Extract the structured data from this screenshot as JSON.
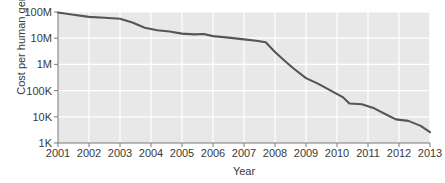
{
  "chart_data": {
    "type": "line",
    "title": "",
    "xlabel": "Year",
    "ylabel": "Cost per human genome ($)",
    "yscale": "log",
    "ylim": [
      1000,
      100000000
    ],
    "xlim": [
      2001,
      2013
    ],
    "grid": true,
    "legend": null,
    "line_color": "#555555",
    "plot_bg": "#e8e8e8",
    "grid_color": "#ffffff",
    "yticks": [
      {
        "value": 100000000,
        "label": "100M"
      },
      {
        "value": 10000000,
        "label": "10M"
      },
      {
        "value": 1000000,
        "label": "1M"
      },
      {
        "value": 100000,
        "label": "100K"
      },
      {
        "value": 10000,
        "label": "10K"
      },
      {
        "value": 1000,
        "label": "1K"
      }
    ],
    "xticks": [
      {
        "value": 2001,
        "label": "2001"
      },
      {
        "value": 2002,
        "label": "2002"
      },
      {
        "value": 2003,
        "label": "2003"
      },
      {
        "value": 2004,
        "label": "2004"
      },
      {
        "value": 2005,
        "label": "2005"
      },
      {
        "value": 2006,
        "label": "2006"
      },
      {
        "value": 2007,
        "label": "2007"
      },
      {
        "value": 2008,
        "label": "2008"
      },
      {
        "value": 2009,
        "label": "2009"
      },
      {
        "value": 2010,
        "label": "2010"
      },
      {
        "value": 2011,
        "label": "2011"
      },
      {
        "value": 2012,
        "label": "2012"
      },
      {
        "value": 2013,
        "label": "2013"
      }
    ],
    "series": [
      {
        "name": "Cost per human genome",
        "x": [
          2001.0,
          2001.5,
          2002.0,
          2002.5,
          2003.0,
          2003.4,
          2003.8,
          2004.2,
          2004.6,
          2005.0,
          2005.4,
          2005.7,
          2006.0,
          2006.5,
          2007.0,
          2007.4,
          2007.7,
          2008.0,
          2008.3,
          2008.6,
          2009.0,
          2009.4,
          2009.8,
          2010.2,
          2010.4,
          2010.8,
          2011.2,
          2011.6,
          2011.9,
          2012.3,
          2012.7,
          2013.0
        ],
        "y": [
          95000000,
          78000000,
          65000000,
          60000000,
          55000000,
          40000000,
          25000000,
          20000000,
          18000000,
          15000000,
          14000000,
          14500000,
          12000000,
          10500000,
          9000000,
          8000000,
          7000000,
          3000000,
          1400000,
          700000,
          300000,
          180000,
          100000,
          55000,
          32000,
          30000,
          21000,
          12000,
          8000,
          7000,
          4500,
          2600
        ]
      }
    ]
  }
}
